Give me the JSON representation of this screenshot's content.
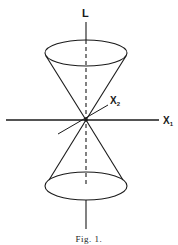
{
  "figure": {
    "axis_vertical_label": "L",
    "axis_horizontal_label": "X",
    "axis_horizontal_subscript": "1",
    "axis_oblique_label": "X",
    "axis_oblique_subscript": "2",
    "caption": "Fig. 1.",
    "colors": {
      "ink": "#1a1a1a",
      "background": "#ffffff"
    }
  }
}
